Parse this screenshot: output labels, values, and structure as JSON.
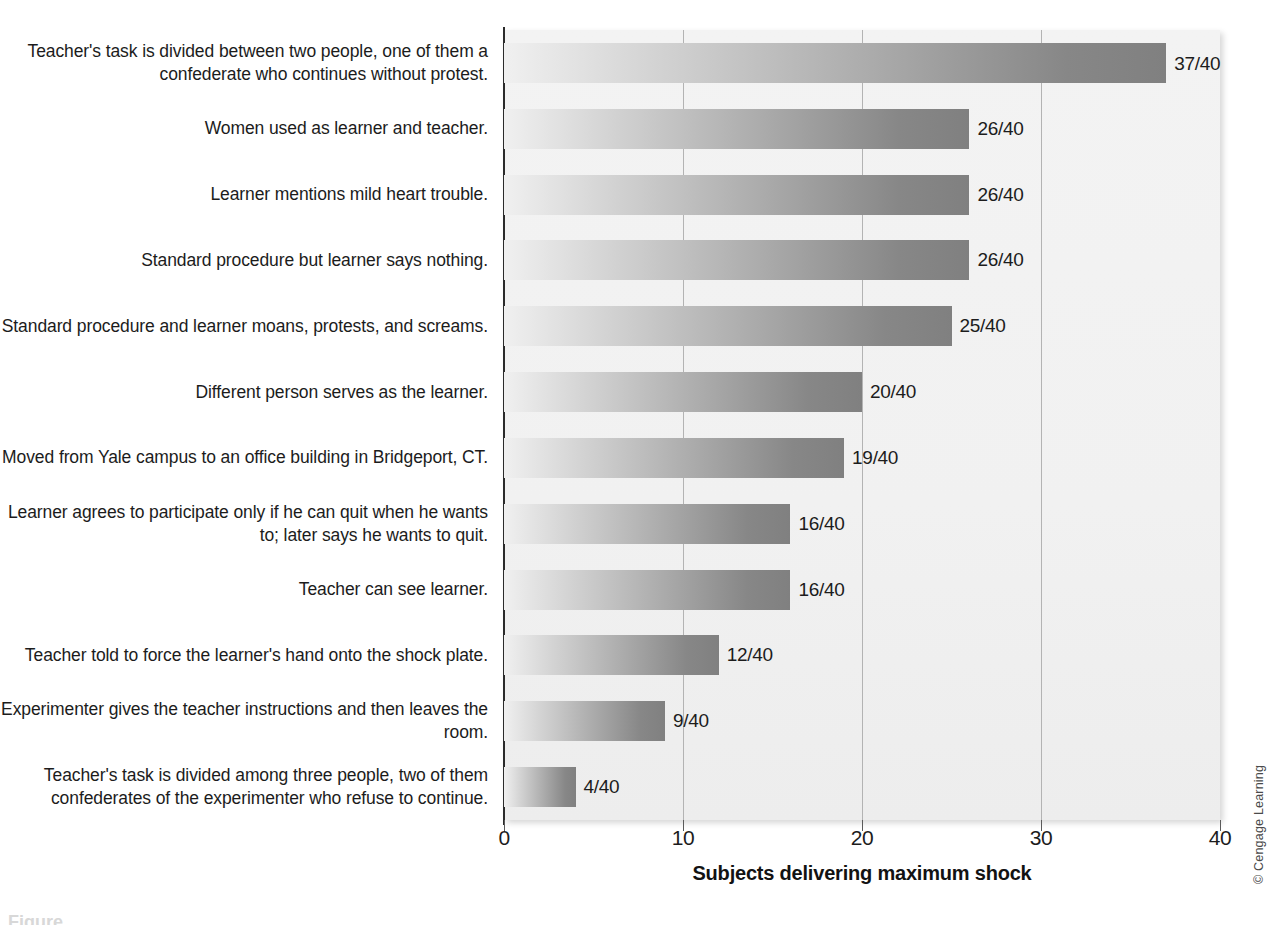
{
  "chart_data": {
    "type": "bar",
    "orientation": "horizontal",
    "title": "",
    "xlabel": "Subjects delivering maximum shock",
    "ylabel": "",
    "xlim": [
      0,
      40
    ],
    "xticks": [
      "0",
      "10",
      "20",
      "30",
      "40"
    ],
    "grid": "vertical",
    "legend": "none",
    "denominator": 40,
    "categories": [
      "Teacher's task is divided between two people, one of them a confederate who continues without protest.",
      "Women used as learner and teacher.",
      "Learner mentions mild heart trouble.",
      "Standard procedure but learner says nothing.",
      "Standard procedure and learner moans, protests, and screams.",
      "Different person serves as the learner.",
      "Moved from Yale campus to an office building in Bridgeport, CT.",
      "Learner agrees to participate only if he can quit when he wants to; later says he wants to quit.",
      "Teacher can see learner.",
      "Teacher told to force the learner's hand onto the shock plate.",
      "Experimenter gives the teacher instructions and then leaves the room.",
      "Teacher's task is divided among three people, two of them confederates of the experimenter who refuse to continue."
    ],
    "values": [
      37,
      26,
      26,
      26,
      25,
      20,
      19,
      16,
      16,
      12,
      9,
      4
    ],
    "value_labels": [
      "37/40",
      "26/40",
      "26/40",
      "26/40",
      "25/40",
      "20/40",
      "19/40",
      "16/40",
      "16/40",
      "12/40",
      "9/40",
      "4/40"
    ]
  },
  "chart": {
    "axis_title": "Subjects delivering maximum shock",
    "tick_labels": [
      "0",
      "10",
      "20",
      "30",
      "40"
    ],
    "bars": [
      {
        "label": "Teacher's task is divided between two people, one of them a confederate who continues without protest.",
        "value": 37,
        "value_label": "37/40",
        "value_label_wrapped": "37/\n40"
      },
      {
        "label": "Women used as learner and teacher.",
        "value": 26,
        "value_label": "26/40"
      },
      {
        "label": "Learner mentions mild heart trouble.",
        "value": 26,
        "value_label": "26/40"
      },
      {
        "label": "Standard procedure but learner says nothing.",
        "value": 26,
        "value_label": "26/40"
      },
      {
        "label": "Standard procedure and learner moans, protests, and screams.",
        "value": 25,
        "value_label": "25/40"
      },
      {
        "label": "Different person serves as the learner.",
        "value": 20,
        "value_label": "20/40"
      },
      {
        "label": "Moved from Yale campus to an office building in Bridgeport, CT.",
        "value": 19,
        "value_label": "19/40"
      },
      {
        "label": "Learner agrees to participate only if he can quit when he wants to; later says he wants to quit.",
        "value": 16,
        "value_label": "16/40"
      },
      {
        "label": "Teacher can see learner.",
        "value": 16,
        "value_label": "16/40"
      },
      {
        "label": "Teacher told to force the learner's hand onto the shock plate.",
        "value": 12,
        "value_label": "12/40"
      },
      {
        "label": "Experimenter gives the teacher instructions and then leaves the room.",
        "value": 9,
        "value_label": "9/40"
      },
      {
        "label": "Teacher's task is divided among three people, two of them confederates of the experimenter who refuse to continue.",
        "value": 4,
        "value_label": "4/40"
      }
    ]
  },
  "credit": "© Cengage Learning",
  "caption_partial": "Figure",
  "colors": {
    "bar_gradient_start": "#f0f0f0",
    "bar_gradient_end": "#808080",
    "plot_background": "#f1f1f1",
    "axis": "#2b2b2b",
    "gridline": "#b3b3b3",
    "text": "#1c1c1c"
  }
}
